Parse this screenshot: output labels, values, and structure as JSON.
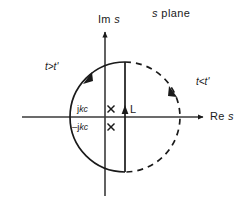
{
  "figure": {
    "background_color": "#ffffff",
    "ink_color": "#1a1a1a",
    "width": 250,
    "height": 211
  },
  "labels": {
    "s_plane": "s plane",
    "imaginary_axis": "Im s",
    "real_axis": "Re s",
    "t_greater": "t>t'",
    "t_less": "t<t'",
    "pole_positive": "jkc",
    "pole_negative": "-jkc",
    "contour_L": "L"
  },
  "axes": {
    "origin": [
      105,
      117
    ],
    "real_axis": {
      "x_start": 22,
      "x_end": 205,
      "y": 117,
      "arrow": "right"
    },
    "imag_axis": {
      "y_start": 30,
      "y_end": 197,
      "x": 105,
      "arrow": "up"
    }
  },
  "contour": {
    "center": [
      125,
      117
    ],
    "radius": 55,
    "solid_arc": {
      "description": "left half circle, Bromwich closure for t greater than t-prime",
      "style": "solid",
      "arrow_direction": "counterclockwise",
      "arrow_at": [
        88,
        78
      ]
    },
    "vertical_segment": {
      "description": "Bromwich line L",
      "x": 125,
      "y_top": 62,
      "y_bottom": 172,
      "style": "solid",
      "arrow_direction": "up",
      "arrow_at": [
        125,
        108
      ]
    },
    "dashed_arc": {
      "description": "right half circle, closure for t less than t-prime",
      "style": "dashed",
      "arrow_direction": "clockwise",
      "arrow_at": [
        172,
        92
      ]
    }
  },
  "poles": [
    {
      "label": "jkc",
      "marker": "cross",
      "x": 111,
      "y": 109
    },
    {
      "label": "-jkc",
      "marker": "cross",
      "x": 111,
      "y": 127
    }
  ]
}
